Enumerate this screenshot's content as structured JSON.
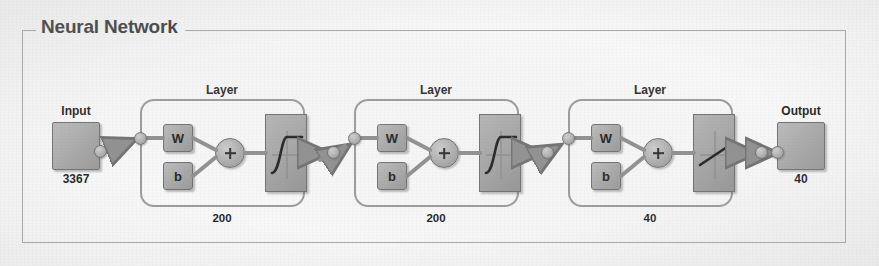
{
  "panel": {
    "title": "Neural Network"
  },
  "input": {
    "label": "Input",
    "size": "3367",
    "icon": "input-block-icon"
  },
  "output": {
    "label": "Output",
    "size": "40",
    "icon": "output-block-icon"
  },
  "layers": [
    {
      "title": "Layer",
      "weight_label": "W",
      "bias_label": "b",
      "sum_label": "+",
      "transfer_function": "sigmoid",
      "size": "200"
    },
    {
      "title": "Layer",
      "weight_label": "W",
      "bias_label": "b",
      "sum_label": "+",
      "transfer_function": "sigmoid",
      "size": "200"
    },
    {
      "title": "Layer",
      "weight_label": "W",
      "bias_label": "b",
      "sum_label": "+",
      "transfer_function": "linear",
      "size": "40"
    }
  ],
  "colors": {
    "block_fill": "#a8a8a8",
    "block_border": "#6f6f6f",
    "panel_border": "#a9a9a9",
    "background": "#fbfbfb",
    "text": "#1c1c1c"
  }
}
